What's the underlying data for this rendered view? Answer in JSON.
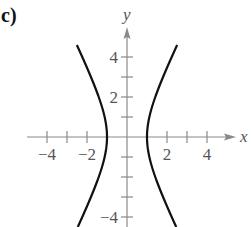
{
  "panel": {
    "label": "c)"
  },
  "chart_data": {
    "type": "line",
    "title": "",
    "equation_implied": "x^2 - y^2/4 = 1",
    "xlabel": "x",
    "ylabel": "y",
    "xlim": [
      -5,
      5
    ],
    "ylim": [
      -4.5,
      5
    ],
    "grid": false,
    "legend": null,
    "x_ticks": [
      -4,
      -3,
      -2,
      -1,
      1,
      2,
      3,
      4
    ],
    "y_ticks": [
      -4,
      -3,
      -2,
      -1,
      1,
      2,
      3,
      4
    ],
    "x_tick_labels": {
      "-4": "−4",
      "-2": "−2",
      "2": "2",
      "4": "4"
    },
    "y_tick_labels": {
      "4": "4",
      "2": "2",
      "-4": "−4"
    },
    "series": [
      {
        "name": "right branch",
        "x": [
          2.5,
          2.0,
          1.5,
          1.2,
          1.0,
          1.2,
          1.5,
          2.0,
          2.5
        ],
        "y": [
          4.58,
          3.46,
          2.24,
          1.33,
          0,
          -1.33,
          -2.24,
          -3.46,
          -4.58
        ]
      },
      {
        "name": "left branch",
        "x": [
          -2.5,
          -2.0,
          -1.5,
          -1.2,
          -1.0,
          -1.2,
          -1.5,
          -2.0,
          -2.5
        ],
        "y": [
          4.58,
          3.46,
          2.24,
          1.33,
          0,
          -1.33,
          -2.24,
          -3.46,
          -4.58
        ]
      }
    ]
  },
  "colors": {
    "axis": "#8a8a8a",
    "curve": "#111111",
    "text": "#555555"
  }
}
